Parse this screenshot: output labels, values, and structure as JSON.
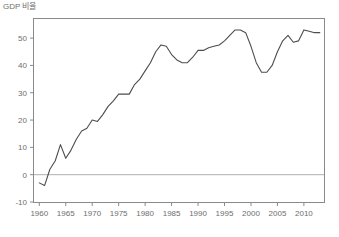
{
  "figure": {
    "background_color": "#ffffff",
    "frame_color": "#8a8a8a",
    "line_color": "#4d4d4d",
    "tick_color": "#8a8a8a",
    "text_color": "#6e6e6e",
    "zero_line_color": "#b0b0b0"
  },
  "chart_data": {
    "type": "line",
    "title": "",
    "ylabel": "GDP 비율",
    "xlabel": "",
    "xlim": [
      1959.0,
      2013.8
    ],
    "ylim": [
      -10,
      57
    ],
    "grid": false,
    "legend": null,
    "zero_reference_line": 0,
    "yticks": [
      -10,
      0,
      10,
      20,
      30,
      40,
      50
    ],
    "ytick_labels": [
      "-10",
      "0",
      "10",
      "20",
      "30",
      "40",
      "50"
    ],
    "xticks": [
      1960,
      1965,
      1970,
      1975,
      1980,
      1985,
      1990,
      1995,
      2000,
      2005,
      2010
    ],
    "xtick_labels": [
      "1960",
      "1965",
      "1970",
      "1975",
      "1980",
      "1985",
      "1990",
      "1995",
      "2000",
      "2005",
      "2010"
    ],
    "x": [
      1960,
      1961,
      1962,
      1963,
      1964,
      1965,
      1966,
      1967,
      1968,
      1969,
      1970,
      1971,
      1972,
      1973,
      1974,
      1975,
      1976,
      1977,
      1978,
      1979,
      1980,
      1981,
      1982,
      1983,
      1984,
      1985,
      1986,
      1987,
      1988,
      1989,
      1990,
      1991,
      1992,
      1993,
      1994,
      1995,
      1996,
      1997,
      1998,
      1999,
      2000,
      2001,
      2002,
      2003,
      2004,
      2005,
      2006,
      2007,
      2008,
      2009,
      2010,
      2011,
      2012,
      2013
    ],
    "values": [
      -3.0,
      -4.0,
      2.0,
      5.0,
      11.0,
      6.0,
      9.0,
      13.0,
      16.0,
      17.0,
      20.0,
      19.5,
      22.0,
      25.0,
      27.0,
      29.5,
      29.5,
      29.5,
      33.0,
      35.0,
      38.0,
      41.0,
      45.0,
      47.5,
      47.0,
      44.0,
      42.0,
      41.0,
      41.0,
      43.0,
      45.5,
      45.5,
      46.5,
      47.0,
      47.5,
      49.0,
      51.0,
      53.0,
      53.0,
      52.0,
      47.0,
      41.0,
      37.5,
      37.5,
      40.0,
      45.0,
      49.0,
      51.0,
      48.5,
      49.0,
      53.0,
      52.5,
      52.0,
      52.0
    ],
    "series_name": "GDP 비율"
  }
}
